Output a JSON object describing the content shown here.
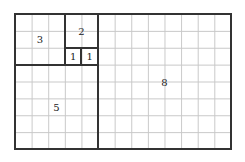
{
  "diagram": {
    "title": "",
    "squares": [
      {
        "label": "3",
        "col": 0,
        "row": 0,
        "size": 3
      },
      {
        "label": "2",
        "col": 3,
        "row": 0,
        "size": 2
      },
      {
        "label": "1",
        "col": 3,
        "row": 2,
        "size": 1
      },
      {
        "label": "1",
        "col": 4,
        "row": 2,
        "size": 1
      },
      {
        "label": "5",
        "col": 0,
        "row": 3,
        "size": 5
      },
      {
        "label": "8",
        "col": 5,
        "row": 0,
        "size": 8
      }
    ],
    "grid": {
      "cols": 13,
      "rows": 8
    }
  }
}
